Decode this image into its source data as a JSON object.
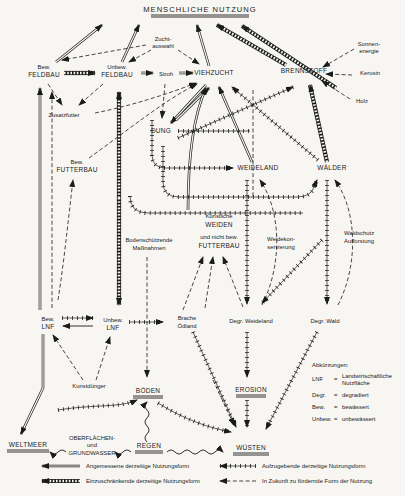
{
  "title": "MENSCHLICHE NUTZUNG",
  "colors": {
    "ink": "#1b1b1b",
    "paper": "#f7f6f2"
  },
  "nodes": {
    "zuchtauswahl": [
      "Zucht-",
      "auswahl"
    ],
    "sonnenenergie": [
      "Sonnen-",
      "energie"
    ],
    "bew_feldbau": [
      "Bew.",
      "FELDBAU"
    ],
    "unbew_feldbau": [
      "Unbew.",
      "FELDBAU"
    ],
    "stroh": [
      "Stroh"
    ],
    "viehzucht": [
      "VIEHZUCHT"
    ],
    "brennstoff": [
      "BRENNSTOFF"
    ],
    "kerosin": [
      "Kerosin"
    ],
    "holz": [
      "Holz"
    ],
    "zusatzfutter": [
      "Zusatzfutter"
    ],
    "dung": [
      "DUNG"
    ],
    "bew_futterbau": [
      "Bew.",
      "FUTTERBAU"
    ],
    "weideland": [
      "WEIDELAND"
    ],
    "waelder": [
      "WÄLDER"
    ],
    "kuenstliche_weiden": [
      "Künstliche",
      "WEIDEN",
      "und nicht bew.",
      "FUTTERBAU"
    ],
    "bodenschuetzende": [
      "Bodenschützende",
      "Maßnahmen"
    ],
    "weidekonservierung": [
      "Weidekon-",
      "servierung"
    ],
    "waldschutz": [
      "Waldschutz",
      "Aufforstung"
    ],
    "bew_lnf": [
      "Bew.",
      "LNF"
    ],
    "unbew_lnf": [
      "Unbew.",
      "LNF"
    ],
    "brache": [
      "Brache",
      "Ödland"
    ],
    "degr_weideland": [
      "Degr. Weideland"
    ],
    "degr_wald": [
      "Degr. Wald"
    ],
    "kunstduenger": [
      "Kunstdünger"
    ],
    "boeden": [
      "BÖDEN"
    ],
    "erosion": [
      "EROSION"
    ],
    "weltmeer": [
      "WELTMEER"
    ],
    "oberflaechenwasser": [
      "OBERFLÄCHEN-",
      "und",
      "GRUNDWASSER"
    ],
    "regen": [
      "REGEN"
    ],
    "wuesten": [
      "WÜSTEN"
    ]
  },
  "abbreviations": {
    "heading": "Abkürzungen:",
    "items": [
      {
        "abbr": "LNF",
        "eq": "=",
        "meaning": [
          "Landwirtschaftliche",
          "Nutzfläche"
        ]
      },
      {
        "abbr": "Degr.",
        "eq": "=",
        "meaning": [
          "degradiert"
        ]
      },
      {
        "abbr": "Bew.",
        "eq": "=",
        "meaning": [
          "bewässert"
        ]
      },
      {
        "abbr": "Unbew.",
        "eq": "=",
        "meaning": [
          "unbewässert"
        ]
      }
    ]
  },
  "legend": {
    "items": [
      {
        "style": "dbl",
        "label": "Angemessene derzeitige Nutzungsform"
      },
      {
        "style": "hatch",
        "label": "Einzuschränkende derzeitige Nutzungsform"
      },
      {
        "style": "tick",
        "label": "Aufzugebende derzeitige Nutzungsform"
      },
      {
        "style": "dash",
        "label": "In Zukunft zu fördernde Form der Nutzung"
      }
    ]
  }
}
